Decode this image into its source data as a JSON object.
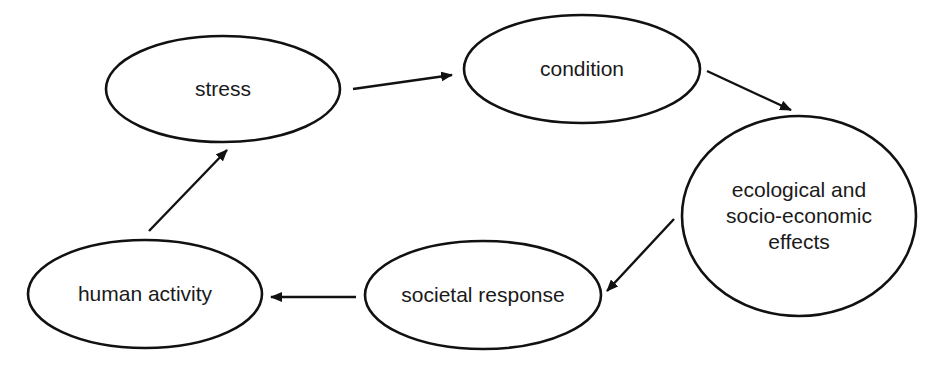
{
  "diagram": {
    "type": "cycle",
    "colors": {
      "stroke": "#111111",
      "fill": "#ffffff",
      "text": "#1a1a1a"
    },
    "nodes": [
      {
        "id": "stress",
        "label_lines": [
          "stress"
        ],
        "cx": 223,
        "cy": 89,
        "rx": 117,
        "ry": 53
      },
      {
        "id": "condition",
        "label_lines": [
          "condition"
        ],
        "cx": 582,
        "cy": 69,
        "rx": 118,
        "ry": 54
      },
      {
        "id": "effects",
        "label_lines": [
          "ecological and",
          "socio-economic",
          "effects"
        ],
        "cx": 799,
        "cy": 216,
        "rx": 117,
        "ry": 100
      },
      {
        "id": "societal-response",
        "label_lines": [
          "societal response"
        ],
        "cx": 483,
        "cy": 295,
        "rx": 118,
        "ry": 54
      },
      {
        "id": "human-activity",
        "label_lines": [
          "human activity"
        ],
        "cx": 145,
        "cy": 294,
        "rx": 117,
        "ry": 54
      }
    ],
    "edges": [
      {
        "from": "stress",
        "to": "condition",
        "x1": 353,
        "y1": 89,
        "x2": 452,
        "y2": 75
      },
      {
        "from": "condition",
        "to": "effects",
        "x1": 707,
        "y1": 71,
        "x2": 791,
        "y2": 110
      },
      {
        "from": "effects",
        "to": "societal-response",
        "x1": 674,
        "y1": 219,
        "x2": 607,
        "y2": 291
      },
      {
        "from": "societal-response",
        "to": "human-activity",
        "x1": 356,
        "y1": 297,
        "x2": 271,
        "y2": 297
      },
      {
        "from": "human-activity",
        "to": "stress",
        "x1": 149,
        "y1": 231,
        "x2": 227,
        "y2": 150
      }
    ]
  }
}
